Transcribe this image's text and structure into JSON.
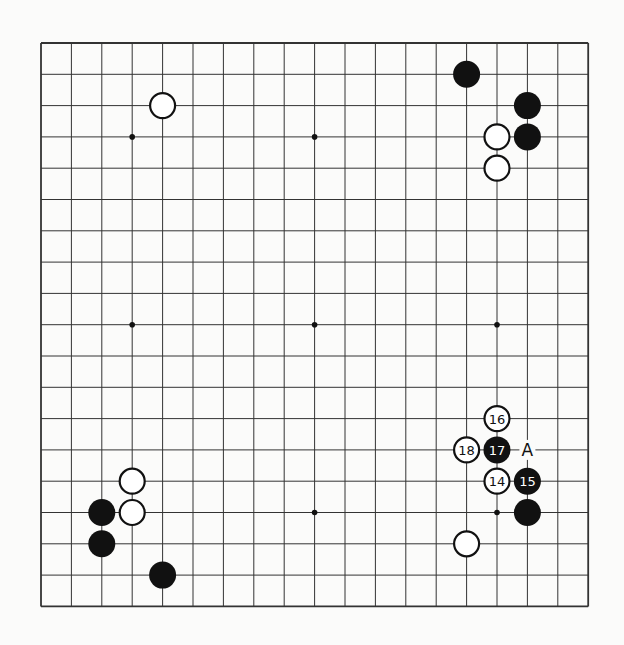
{
  "diagram": {
    "type": "go-board",
    "size": 19,
    "colors": {
      "background": "#fbfbfa",
      "line": "#333333",
      "black": "#111111",
      "white": "#ffffff"
    },
    "geometry": {
      "left": 41,
      "top": 43,
      "dx": 30.4,
      "dy": 31.3,
      "stone_radius": 13
    },
    "star_points": [
      [
        3,
        3
      ],
      [
        9,
        3
      ],
      [
        3,
        9
      ],
      [
        9,
        9
      ],
      [
        15,
        9
      ],
      [
        9,
        15
      ],
      [
        15,
        15
      ]
    ],
    "stones": [
      {
        "color": "white",
        "col": 4,
        "row": 2,
        "label": ""
      },
      {
        "color": "black",
        "col": 14,
        "row": 1,
        "label": ""
      },
      {
        "color": "black",
        "col": 16,
        "row": 2,
        "label": ""
      },
      {
        "color": "black",
        "col": 16,
        "row": 3,
        "label": ""
      },
      {
        "color": "white",
        "col": 15,
        "row": 3,
        "label": ""
      },
      {
        "color": "white",
        "col": 15,
        "row": 4,
        "label": ""
      },
      {
        "color": "white",
        "col": 15,
        "row": 12,
        "label": "16"
      },
      {
        "color": "white",
        "col": 14,
        "row": 13,
        "label": "18"
      },
      {
        "color": "black",
        "col": 15,
        "row": 13,
        "label": "17"
      },
      {
        "color": "white",
        "col": 15,
        "row": 14,
        "label": "14"
      },
      {
        "color": "black",
        "col": 16,
        "row": 14,
        "label": "15"
      },
      {
        "color": "black",
        "col": 16,
        "row": 15,
        "label": ""
      },
      {
        "color": "white",
        "col": 14,
        "row": 16,
        "label": ""
      },
      {
        "color": "white",
        "col": 3,
        "row": 14,
        "label": ""
      },
      {
        "color": "white",
        "col": 3,
        "row": 15,
        "label": ""
      },
      {
        "color": "black",
        "col": 2,
        "row": 15,
        "label": ""
      },
      {
        "color": "black",
        "col": 2,
        "row": 16,
        "label": ""
      },
      {
        "color": "black",
        "col": 4,
        "row": 17,
        "label": ""
      }
    ],
    "markers": [
      {
        "col": 16,
        "row": 13,
        "label": "A"
      }
    ]
  }
}
